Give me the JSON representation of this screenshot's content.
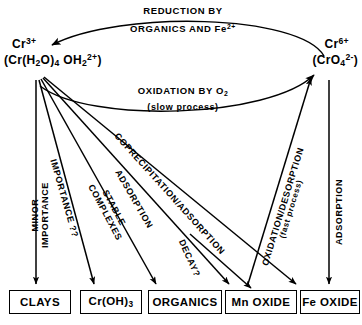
{
  "diagram": {
    "background_color": "#ffffff",
    "line_color": "#000000"
  },
  "nodes": {
    "left": {
      "name": "chromium-III-node",
      "species_line1": "Cr",
      "species_line1_charge": "3+",
      "species_line2_prefix": "(Cr(H",
      "species_line2_sub1": "2",
      "species_line2_mid": "O)",
      "species_line2_sub2": "4",
      "species_line2_mid2": " OH",
      "species_line2_sub3": "2",
      "species_line2_sup": "2+",
      "species_line2_suffix": ")",
      "plain_line1": "Cr 3+",
      "plain_line2": "(Cr(H2O)4 OH2 2+)"
    },
    "right": {
      "name": "chromium-VI-node",
      "species_line1": "Cr",
      "species_line1_charge": "6+",
      "species_line2_prefix": "(CrO",
      "species_line2_sub": "4",
      "species_line2_sup": "2-",
      "species_line2_suffix": ")",
      "plain_line1": "Cr 6+",
      "plain_line2": "(CrO4 2-)"
    }
  },
  "arc_labels": {
    "reduction": {
      "line1": "REDUCTION BY",
      "line2_prefix": "ORGANICS AND Fe",
      "line2_sup": "2+",
      "plain": "REDUCTION BY ORGANICS AND Fe2+"
    },
    "oxidation": {
      "line1_prefix": "OXIDATION BY O",
      "line1_sub": "2",
      "line2": "(slow process)",
      "plain": "OXIDATION BY O2 (slow process)"
    }
  },
  "path_labels": [
    {
      "id": "minor-importance",
      "line1": "MINOR",
      "line2": "IMPORTANCE",
      "plain": "MINOR IMPORTANCE"
    },
    {
      "id": "importance-unknown",
      "line1": "IMPORTANCE ??",
      "plain": "IMPORTANCE ??"
    },
    {
      "id": "stable-complexes",
      "line1": "STABLE",
      "line2": "COMPLEXES",
      "plain": "STABLE COMPLEXES"
    },
    {
      "id": "adsorption-organics",
      "line1": "ADSORPTION",
      "plain": "ADSORPTION"
    },
    {
      "id": "coprecipitation-adsorption",
      "line1": "COPRECIPITATION/ADSORPTION",
      "plain": "COPRECIPITATION/ADSORPTION"
    },
    {
      "id": "decay",
      "line1": "DECAY?",
      "plain": "DECAY?"
    },
    {
      "id": "oxidation-desorption",
      "line1": "OXIDATION/DESORPTION",
      "line2": "(fast process)",
      "plain": "OXIDATION/DESORPTION (fast process)"
    },
    {
      "id": "adsorption-fe-oxide",
      "line1": "ADSORPTION",
      "plain": "ADSORPTION"
    }
  ],
  "boxes": [
    {
      "id": "clays",
      "label": "CLAYS"
    },
    {
      "id": "cr-oh-3",
      "label_prefix": "Cr(OH)",
      "label_sub": "3",
      "plain": "Cr(OH)3"
    },
    {
      "id": "organics",
      "label": "ORGANICS"
    },
    {
      "id": "mn-oxide",
      "label": "Mn OXIDE"
    },
    {
      "id": "fe-oxide",
      "label": "Fe OXIDE"
    }
  ]
}
